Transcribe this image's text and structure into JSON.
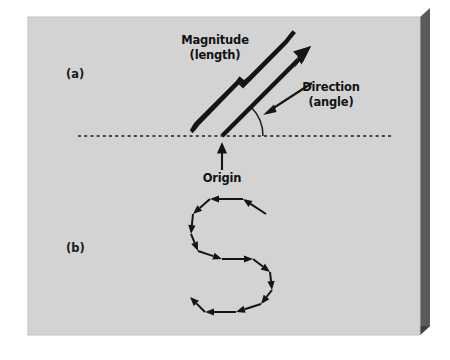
{
  "figure": {
    "background_color": "#ffffff",
    "board_color": "#d2d2d2",
    "board_shadow_color": "#4a4a4a",
    "board_edge_color": "#6e6e6e",
    "ink_color": "#141414",
    "panels": [
      {
        "id": "a",
        "label": "(a)",
        "label_x": 66,
        "label_y": 78,
        "description": "A single vector drawn from an origin on a horizontal dashed reference line, with its length braced and its angle arced."
      },
      {
        "id": "b",
        "label": "(b)",
        "label_x": 66,
        "label_y": 252,
        "description": "A head-to-tail chain of equal vectors tracing an S-shaped path."
      }
    ],
    "callouts": [
      {
        "name": "magnitude",
        "lines": [
          "Magnitude",
          "(length)"
        ],
        "x": 215,
        "y": 42,
        "anchor": "middle",
        "line_height": 15
      },
      {
        "name": "direction",
        "lines": [
          "Direction",
          "(angle)"
        ],
        "x": 330,
        "y": 90,
        "anchor": "middle",
        "line_height": 15
      },
      {
        "name": "origin",
        "lines": [
          "Origin"
        ],
        "x": 222,
        "y": 178,
        "anchor": "middle",
        "line_height": 15
      }
    ],
    "reference_line": {
      "name": "baseline",
      "style": "dashed",
      "x1": 78,
      "x2": 392,
      "y": 136,
      "dash": "3,3.2",
      "width": 1.6
    },
    "main_vector": {
      "origin_x": 222,
      "origin_y": 136,
      "tip_x": 311,
      "tip_y": 46,
      "angle_degrees": 45,
      "shaft_width": 4.2,
      "head_length": 20,
      "head_half_width": 6.5
    },
    "magnitude_brace": {
      "start_x": 197,
      "start_y": 118,
      "end_x": 288,
      "end_y": 28,
      "thickness": 5.0,
      "notch_offset": 5
    },
    "angle_arc": {
      "center_x": 222,
      "center_y": 136,
      "radius": 41,
      "start_degrees": 0,
      "end_degrees": 45
    },
    "direction_pointer": {
      "from_x": 311,
      "from_y": 84,
      "to_x": 264,
      "to_y": 114
    },
    "origin_pointer": {
      "from_x": 222,
      "from_y": 170,
      "to_x": 222,
      "to_y": 144
    },
    "vector_chain": {
      "name": "s-shaped-vector-chain",
      "segment_count": 11,
      "stroke_width": 2.0,
      "head_length": 9,
      "head_half_width": 3.6,
      "points": [
        [
          266,
          214
        ],
        [
          243,
          199
        ],
        [
          210,
          199
        ],
        [
          193,
          214
        ],
        [
          191,
          234
        ],
        [
          198,
          251
        ],
        [
          222,
          259
        ],
        [
          253,
          259
        ],
        [
          270,
          272
        ],
        [
          272,
          290
        ],
        [
          261,
          304
        ],
        [
          236,
          312
        ],
        [
          205,
          312
        ],
        [
          190,
          297
        ]
      ]
    }
  }
}
